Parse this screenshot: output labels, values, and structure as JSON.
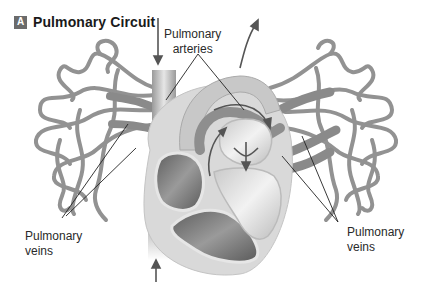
{
  "figure": {
    "badge": "A",
    "title": "Pulmonary Circuit"
  },
  "labels": {
    "arteries": {
      "line1": "Pulmonary",
      "line2": "arteries"
    },
    "veins_left": {
      "line1": "Pulmonary",
      "line2": "veins"
    },
    "veins_right": {
      "line1": "Pulmonary",
      "line2": "veins"
    }
  },
  "colors": {
    "vessel": "#8f8f8f",
    "vessel_light": "#b8b8b8",
    "heart_outer": "#d8d8d8",
    "chamber_dark": "#6e6e6e",
    "arrow": "#555555",
    "leader_line": "#222222"
  }
}
